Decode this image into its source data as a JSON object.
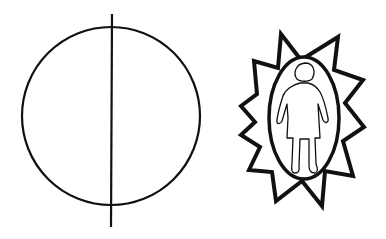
{
  "figure": {
    "symbols": [
      {
        "id": "divided-circle",
        "label": "circle bisected by vertical line",
        "stroke_color": "#111111"
      },
      {
        "id": "sun-person",
        "label": "standing person inside oval surrounded by spiked star",
        "stroke_color": "#111111",
        "spike_count": 13
      }
    ]
  },
  "colors": {
    "background": "#ffffff",
    "ink": "#111111"
  }
}
